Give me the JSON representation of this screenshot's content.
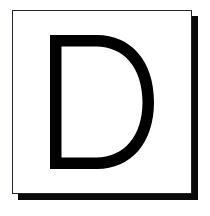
{
  "canvas": {
    "width": 210,
    "height": 216,
    "background_color": "#ffffff"
  },
  "tile": {
    "name": "letter-tile",
    "card_fill": "#ffffff",
    "border_color": "#23232b",
    "shadow_color": "#0a0a0a",
    "shadow_offset_x": 6,
    "shadow_offset_y": 6,
    "card_left": 12,
    "card_top": 10,
    "card_width": 180,
    "card_height": 184
  },
  "glyph": {
    "character": "D",
    "label": "letter-d",
    "color": "#000000",
    "stroke_weight": "bold",
    "style": "sans-serif-uppercase",
    "left": 53,
    "top": 32,
    "width": 104,
    "height": 134
  }
}
